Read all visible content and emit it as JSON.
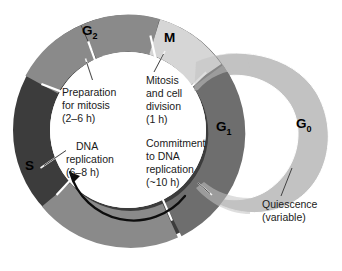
{
  "diagram": {
    "type": "cell-cycle-ring",
    "phases": [
      {
        "id": "M",
        "label": "M",
        "color": "#d6d6d6",
        "start_deg": -74,
        "end_deg": -36,
        "caption": [
          "Mitosis",
          "and cell",
          "division",
          "(1 h)"
        ]
      },
      {
        "id": "G1",
        "label": "G",
        "sub": "1",
        "color": "#6e6e6e",
        "start_deg": -34,
        "end_deg": 62
      },
      {
        "id": "S",
        "label": "S",
        "color": "#3c3c3c",
        "start_deg": 140,
        "end_deg": 244,
        "caption": [
          "DNA",
          "replication",
          "(6–8 h)"
        ]
      },
      {
        "id": "G2",
        "label": "G",
        "sub": "2",
        "color": "#8a8a8a",
        "start_deg": 246,
        "end_deg": 286,
        "caption": [
          "Preparation",
          "for mitosis",
          "(2–6 h)"
        ]
      },
      {
        "id": "G1b",
        "label": "",
        "color": "#8a8a8a",
        "start_deg": 64,
        "end_deg": 138
      }
    ],
    "g0": {
      "label": "G",
      "sub": "0",
      "color": "#c2c2c2",
      "caption": [
        "Quiescence",
        "(variable)"
      ]
    },
    "commitment_caption": [
      "Commitment",
      "to DNA",
      "replication",
      "(~10 h)"
    ],
    "arrow": {
      "direction": "counter-clockwise"
    },
    "colors": {
      "m": "#d6d6d6",
      "g1": "#6e6e6e",
      "s": "#3c3c3c",
      "g2": "#8a8a8a",
      "g0": "#c2c2c2",
      "background": "#ffffff",
      "text": "#1a1a1a"
    }
  },
  "labels": {
    "g2_main": "G",
    "g2_sub": "2",
    "m": "M",
    "g1_main": "G",
    "g1_sub": "1",
    "g0_main": "G",
    "g0_sub": "0",
    "s": "S"
  },
  "captions": {
    "prep_1": "Preparation",
    "prep_2": "for mitosis",
    "prep_3": "(2–6 h)",
    "mit_1": "Mitosis",
    "mit_2": "and cell",
    "mit_3": "division",
    "mit_4": "(1 h)",
    "dna_1": "DNA",
    "dna_2": "replication",
    "dna_3": "(6–8 h)",
    "com_1": "Commitment",
    "com_2": "to DNA",
    "com_3": "replication",
    "com_4": "(~10 h)",
    "qui_1": "Quiescence",
    "qui_2": "(variable)"
  }
}
